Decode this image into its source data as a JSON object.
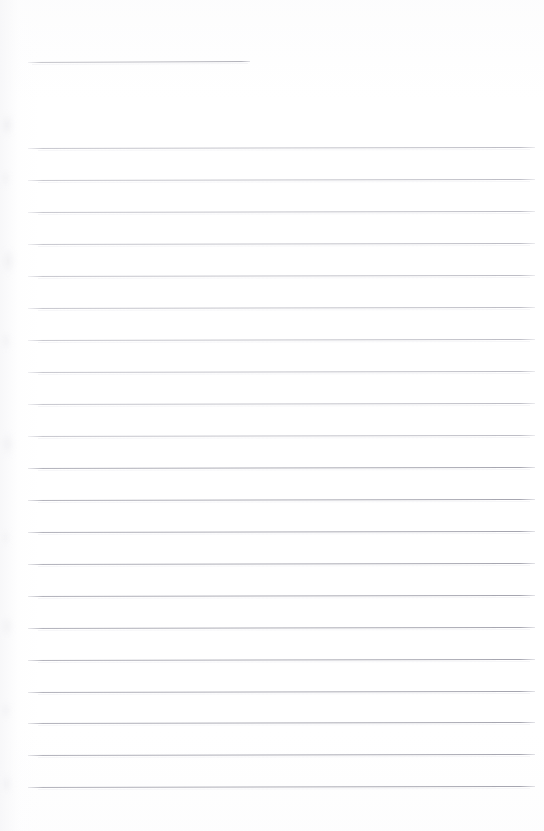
{
  "document": {
    "kind": "lined-notepaper-scan",
    "title_line_present": true,
    "content_text": "",
    "page_background_color": "#ffffff",
    "rule_color": "#c9c9ce",
    "rule_color_lower": "#acacb5",
    "page_width": 544,
    "page_height": 831
  },
  "header_rule": {
    "label": "title-entry-line",
    "y": 62,
    "x_start": 28,
    "x_end": 250,
    "slant_px": -1
  },
  "body_rules": {
    "label": "ruled-writing-lines",
    "count": 21,
    "x_start": 28,
    "x_end": 535,
    "spacing": 32,
    "first_y": 148,
    "last_y": 787,
    "y_positions": [
      148,
      180,
      212,
      244,
      276,
      308,
      340,
      372,
      404,
      436,
      468,
      500,
      532,
      564,
      596,
      628,
      660,
      692,
      723,
      755,
      787
    ],
    "slant_px": -1
  },
  "margin_smudges": [
    {
      "top": 112,
      "width": 14,
      "height": 26,
      "opacity": 0.55
    },
    {
      "top": 168,
      "width": 11,
      "height": 20,
      "opacity": 0.4
    },
    {
      "top": 246,
      "width": 16,
      "height": 30,
      "opacity": 0.5
    },
    {
      "top": 330,
      "width": 12,
      "height": 22,
      "opacity": 0.38
    },
    {
      "top": 430,
      "width": 15,
      "height": 28,
      "opacity": 0.45
    },
    {
      "top": 528,
      "width": 11,
      "height": 19,
      "opacity": 0.35
    },
    {
      "top": 614,
      "width": 14,
      "height": 25,
      "opacity": 0.42
    },
    {
      "top": 700,
      "width": 12,
      "height": 21,
      "opacity": 0.36
    },
    {
      "top": 772,
      "width": 13,
      "height": 24,
      "opacity": 0.4
    }
  ],
  "footer_margin": {
    "label": "bottom-blank-margin",
    "top": 787,
    "height": 44
  }
}
